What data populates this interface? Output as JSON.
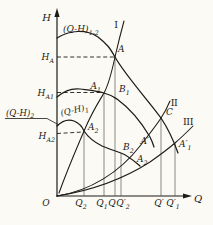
{
  "figure": {
    "axes": {
      "h_axis": "H",
      "q_axis": "Q",
      "origin": "O"
    },
    "curves": {
      "combined_m": "(Q-H)",
      "combined_s": "1-2",
      "pump1_m": "(Q-H)",
      "pump1_s": "1",
      "pump2_m": "(Q-H)",
      "pump2_s": "2"
    },
    "pipelines": {
      "one": "I",
      "two": "II",
      "three": "III"
    },
    "heads": {
      "hA_m": "H",
      "hA_s": "A",
      "hA1_m": "H",
      "hA1_s": "A1",
      "hA2_m": "H",
      "hA2_s": "A2"
    },
    "points": {
      "A": "A",
      "A1_m": "A",
      "A1_s": "1",
      "B1_m": "B",
      "B1_s": "1",
      "A2_m": "A",
      "A2_s": "2",
      "C": "C",
      "Ap": "A′",
      "Ap1_m": "A′",
      "Ap1_s": "1",
      "B2_m": "B",
      "B2_s": "2",
      "A2b_m": "A",
      "A2b_s": "2"
    },
    "x_ticks": {
      "q2_m": "Q",
      "q2_s": "2",
      "q1_m": "Q",
      "q1_s": "1",
      "q": "Q",
      "qp2_m": "Q′",
      "qp2_s": "2",
      "qp": "Q′",
      "qp1_m": "Q′",
      "qp1_s": "1"
    }
  }
}
